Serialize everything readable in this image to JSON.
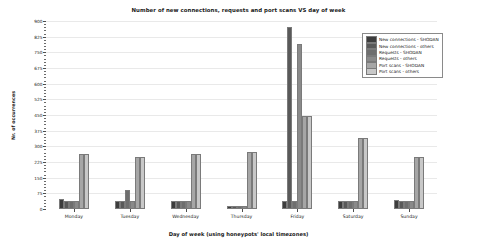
{
  "chart_data": {
    "type": "bar",
    "title": "Number of new connections, requests and port scans VS day of week",
    "xlabel": "Day of week (using honeypots' local timezones)",
    "ylabel": "Nr. of occurrences",
    "categories": [
      "Monday",
      "Tuesday",
      "Wednesday",
      "Thursday",
      "Friday",
      "Saturday",
      "Sunday"
    ],
    "ylim": [
      0,
      900
    ],
    "yticks": [
      0,
      75,
      150,
      225,
      300,
      375,
      450,
      525,
      600,
      675,
      750,
      825,
      900
    ],
    "ytick_labels": [
      "0",
      "75",
      "150",
      "225",
      "300",
      "375",
      "450",
      "525",
      "600",
      "675",
      "750",
      "825",
      "900"
    ],
    "grid": true,
    "legend_position": "upper right",
    "series": [
      {
        "name": "New connections - SHODAN",
        "color": "#3d3d3d",
        "values": [
          48,
          38,
          36,
          14,
          40,
          37,
          45
        ]
      },
      {
        "name": "New connections - others",
        "color": "#595959",
        "values": [
          38,
          38,
          36,
          14,
          870,
          37,
          40
        ]
      },
      {
        "name": "Requests - SHODAN",
        "color": "#6e6e6e",
        "values": [
          38,
          90,
          36,
          14,
          40,
          37,
          40
        ]
      },
      {
        "name": "Requests - others",
        "color": "#8a8a8a",
        "values": [
          38,
          38,
          36,
          14,
          790,
          37,
          40
        ]
      },
      {
        "name": "Port scans - SHODAN",
        "color": "#a6a6a6",
        "values": [
          262,
          250,
          265,
          272,
          445,
          340,
          250
        ]
      },
      {
        "name": "Port scans - others",
        "color": "#c8c8c8",
        "values": [
          262,
          250,
          265,
          272,
          445,
          340,
          250
        ]
      }
    ]
  },
  "colors": {
    "background": "#ffffff",
    "axis": "#4d4d4d",
    "grid": "#e9e9e9",
    "text": "#1a1a1a"
  }
}
